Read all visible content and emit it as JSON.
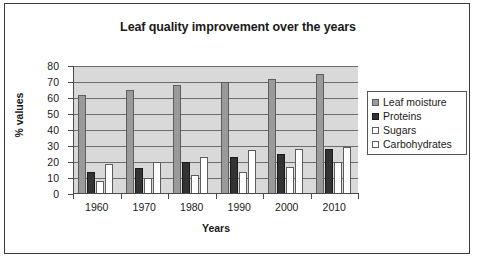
{
  "chart_data": {
    "type": "bar",
    "title": "Leaf quality improvement over the years",
    "xlabel": "Years",
    "ylabel": "% values",
    "categories": [
      "1960",
      "1970",
      "1980",
      "1990",
      "2000",
      "2010"
    ],
    "series": [
      {
        "name": "Leaf moisture",
        "color": "#9a9a9a",
        "values": [
          62,
          65,
          68,
          70,
          72,
          75
        ]
      },
      {
        "name": "Proteins",
        "color": "#333333",
        "values": [
          14,
          16,
          20,
          23,
          25,
          28
        ]
      },
      {
        "name": "Sugars",
        "color": "#ffffff",
        "values": [
          8,
          10,
          12,
          14,
          17,
          20
        ]
      },
      {
        "name": "Carbohydrates",
        "color": "#ffffff",
        "values": [
          19,
          20,
          23,
          27.5,
          28,
          29.5
        ]
      }
    ],
    "ylim": [
      0,
      80
    ],
    "yticks": [
      0,
      10,
      20,
      30,
      40,
      50,
      60,
      70,
      80
    ],
    "ytick_labels": [
      "0",
      "10",
      "20",
      "30",
      "40",
      "50",
      "60",
      "70",
      "80"
    ],
    "grid": true,
    "legend_position": "right",
    "plot_background": "#d9d9d9",
    "frame_color": "#3a3a3a"
  }
}
